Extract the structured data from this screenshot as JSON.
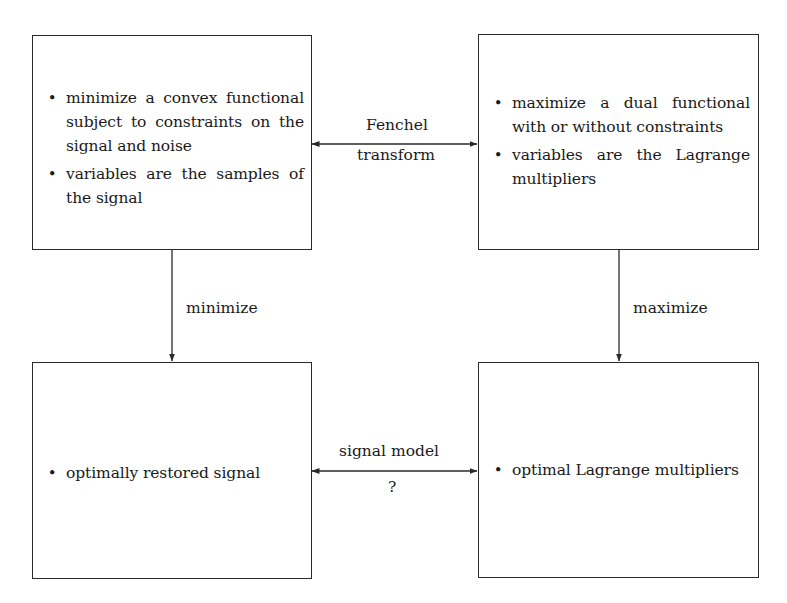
{
  "diagram": {
    "boxes": {
      "primal": {
        "items": [
          "minimize a convex functional subject to constraints on the signal and noise",
          "variables are the samples of the signal"
        ]
      },
      "dual": {
        "items": [
          "maximize a dual functional with or without constraints",
          "variables are the Lagrange multipliers"
        ]
      },
      "restored": {
        "items": [
          "optimally restored signal"
        ]
      },
      "optimal_multipliers": {
        "items": [
          "optimal Lagrange multipliers"
        ]
      }
    },
    "arrows": {
      "fenchel": {
        "label_top": "Fenchel",
        "label_bottom": "transform",
        "direction": "bidirectional"
      },
      "minimize": {
        "label": "minimize",
        "direction": "down"
      },
      "maximize": {
        "label": "maximize",
        "direction": "down"
      },
      "signal_model": {
        "label_top": "signal model",
        "label_bottom": "?",
        "direction": "bidirectional"
      }
    },
    "bullet_glyph": "•",
    "colors": {
      "line": "#2a2a2a",
      "text": "#1a1a1a",
      "background": "#ffffff"
    }
  }
}
